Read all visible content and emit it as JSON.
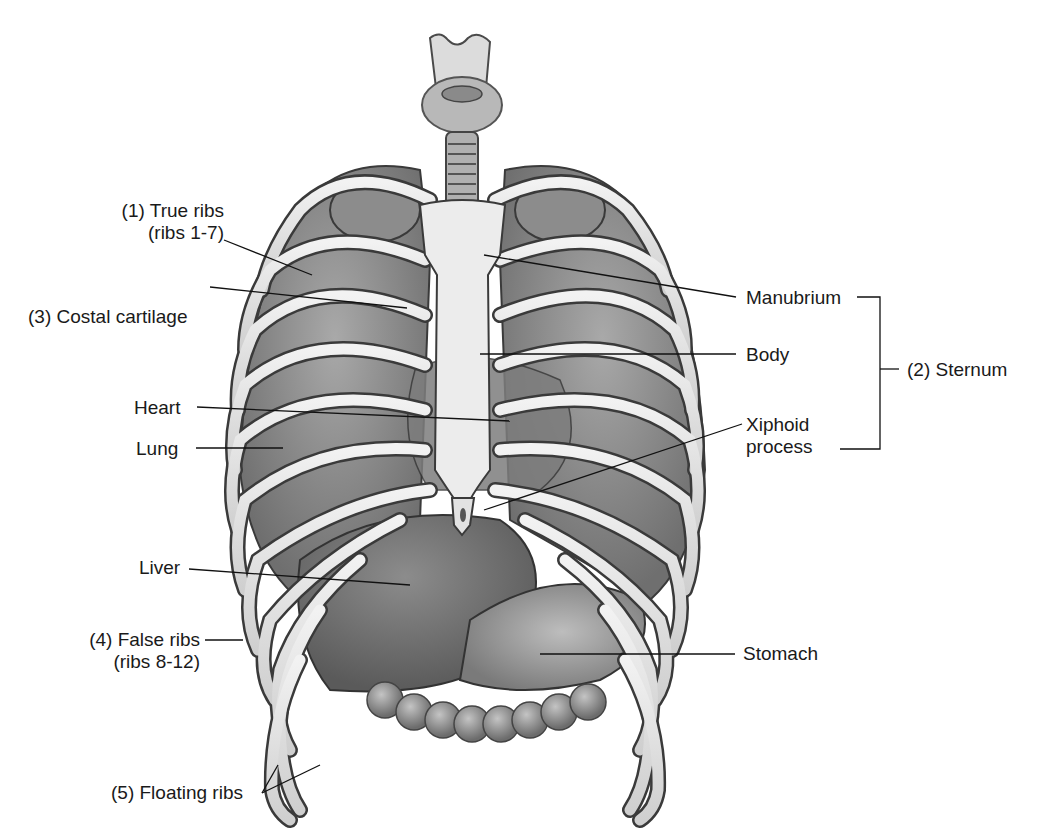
{
  "figure": {
    "palette": {
      "background": "#ffffff",
      "bone": "#e4e4e4",
      "bone_outline": "#3a3a3a",
      "organ_dark": "#6e6e6e",
      "organ_mid": "#8a8a8a",
      "lung": "#8f8f8f",
      "leader_line": "#111111",
      "text": "#1a1a1a"
    }
  },
  "labels": {
    "true_ribs": {
      "line1": "(1) True ribs",
      "line2": "(ribs 1-7)"
    },
    "costal_cartilage": "(3) Costal cartilage",
    "heart": "Heart",
    "lung": "Lung",
    "liver": "Liver",
    "false_ribs": {
      "line1": "(4) False ribs",
      "line2": "(ribs 8-12)"
    },
    "floating_ribs": "(5) Floating ribs",
    "manubrium": "Manubrium",
    "body": "Body",
    "xiphoid": {
      "line1": "Xiphoid",
      "line2": "process"
    },
    "sternum_group": "(2) Sternum",
    "stomach": "Stomach"
  }
}
